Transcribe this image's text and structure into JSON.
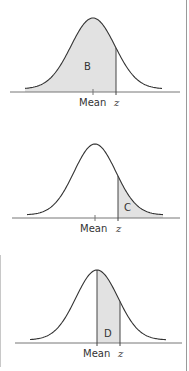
{
  "colors": {
    "curve": "#333333",
    "axis": "#777777",
    "shade": "#e2e2e2",
    "frame": "#9a9a9a"
  },
  "panels": [
    {
      "id": "B",
      "region_label": "B",
      "shaded_region": "left-of-z",
      "mean_label": "Mean",
      "z_label": "z"
    },
    {
      "id": "C",
      "region_label": "C",
      "shaded_region": "right-of-z",
      "mean_label": "Mean",
      "z_label": "z"
    },
    {
      "id": "D",
      "region_label": "D",
      "shaded_region": "mean-to-z",
      "mean_label": "Mean",
      "z_label": "z"
    }
  ]
}
